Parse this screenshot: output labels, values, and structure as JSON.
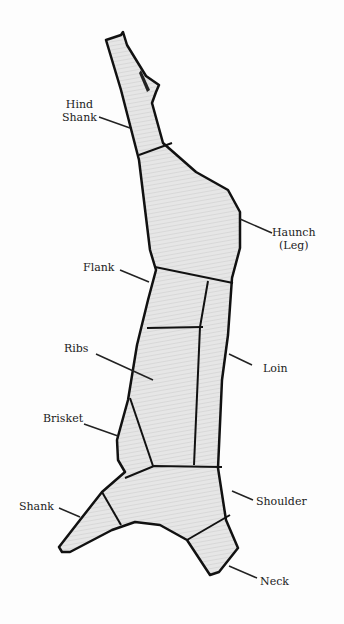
{
  "diagram": {
    "labels": [
      {
        "id": "hind-shank",
        "line1": "Hind",
        "line2": "Shank"
      },
      {
        "id": "haunch",
        "line1": "Haunch",
        "line2": "(Leg)"
      },
      {
        "id": "flank",
        "line1": "Flank",
        "line2": ""
      },
      {
        "id": "ribs",
        "line1": "Ribs",
        "line2": ""
      },
      {
        "id": "loin",
        "line1": "Loin",
        "line2": ""
      },
      {
        "id": "brisket",
        "line1": "Brisket",
        "line2": ""
      },
      {
        "id": "shank",
        "line1": "Shank",
        "line2": ""
      },
      {
        "id": "shoulder",
        "line1": "Shoulder",
        "line2": ""
      },
      {
        "id": "neck",
        "line1": "Neck",
        "line2": ""
      }
    ],
    "colors": {
      "outline": "#111111",
      "fill": "#dcdcdc",
      "fill_light": "#e9e9e9",
      "background": "#fdfdfd"
    }
  }
}
